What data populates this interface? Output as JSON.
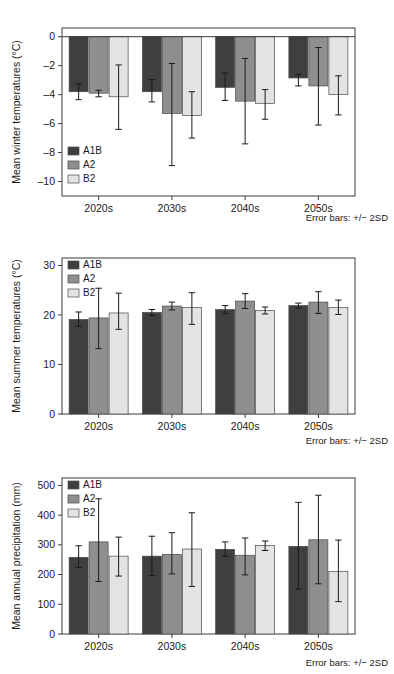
{
  "figure": {
    "background_color": "#ffffff",
    "series_colors": {
      "A1B": "#3f3f3f",
      "A2": "#8f8f8f",
      "B2": "#e3e3e3"
    },
    "axis_color": "#3b3b3b",
    "error_bar_color": "#1a1a1a"
  },
  "panels": [
    {
      "id": "winter",
      "note": "Error bars: +/− 2SD",
      "legend_position": "bottom-left"
    },
    {
      "id": "summer",
      "note": "Error bars: +/− 2SD",
      "legend_position": "top-left"
    },
    {
      "id": "precipitation",
      "note": "Error bars: +/− 2SD",
      "legend_position": "top-left"
    }
  ],
  "chart_data": [
    {
      "type": "bar",
      "id": "winter",
      "title": "",
      "xlabel": "",
      "ylabel": "Mean winter temperatures (°C)",
      "categories": [
        "2020s",
        "2030s",
        "2040s",
        "2050s"
      ],
      "ylim": [
        -11,
        0.6
      ],
      "yticks": [
        0,
        -2,
        -4,
        -6,
        -8,
        -10
      ],
      "yticklabels": [
        "0",
        "–2",
        "–4",
        "–6",
        "–8",
        "–10"
      ],
      "grid": false,
      "legend": [
        "A1B",
        "A2",
        "B2"
      ],
      "annotation": "Error bars: +/− 2SD",
      "series": [
        {
          "name": "A1B",
          "color": "#3f3f3f",
          "values": [
            -3.8,
            -3.8,
            -3.5,
            -2.85
          ],
          "err_low": [
            -4.35,
            -4.5,
            -4.4,
            -3.4
          ],
          "err_high": [
            -3.25,
            -2.95,
            -2.5,
            -2.6
          ]
        },
        {
          "name": "A2",
          "color": "#8f8f8f",
          "values": [
            -3.9,
            -5.3,
            -4.45,
            -3.4
          ],
          "err_low": [
            -4.15,
            -8.9,
            -7.4,
            -6.1
          ],
          "err_high": [
            -3.7,
            -1.85,
            -1.5,
            -0.75
          ]
        },
        {
          "name": "B2",
          "color": "#e3e3e3",
          "values": [
            -4.15,
            -5.45,
            -4.6,
            -4.0
          ],
          "err_low": [
            -6.4,
            -7.0,
            -5.7,
            -5.4
          ],
          "err_high": [
            -1.95,
            -3.8,
            -3.65,
            -2.7
          ]
        }
      ]
    },
    {
      "type": "bar",
      "id": "summer",
      "title": "",
      "xlabel": "",
      "ylabel": "Mean summer temperatures (°C)",
      "categories": [
        "2020s",
        "2030s",
        "2040s",
        "2050s"
      ],
      "ylim": [
        0,
        31.5
      ],
      "yticks": [
        0,
        10,
        20,
        30
      ],
      "yticklabels": [
        "0",
        "10",
        "20",
        "30"
      ],
      "grid": false,
      "legend": [
        "A1B",
        "A2",
        "B2"
      ],
      "annotation": "Error bars: +/− 2SD",
      "series": [
        {
          "name": "A1B",
          "color": "#3f3f3f",
          "values": [
            19.1,
            20.5,
            21.1,
            21.9
          ],
          "err_low": [
            17.7,
            19.9,
            20.3,
            21.4
          ],
          "err_high": [
            20.6,
            21.1,
            21.9,
            22.4
          ]
        },
        {
          "name": "A2",
          "color": "#8f8f8f",
          "values": [
            19.4,
            21.8,
            22.8,
            22.6
          ],
          "err_low": [
            13.2,
            21.0,
            21.3,
            20.3
          ],
          "err_high": [
            25.4,
            22.6,
            24.3,
            24.7
          ]
        },
        {
          "name": "B2",
          "color": "#e3e3e3",
          "values": [
            20.4,
            21.5,
            20.9,
            21.5
          ],
          "err_low": [
            17.1,
            18.1,
            20.2,
            20.1
          ],
          "err_high": [
            24.4,
            24.5,
            21.6,
            23.0
          ]
        }
      ]
    },
    {
      "type": "bar",
      "id": "precipitation",
      "title": "",
      "xlabel": "",
      "ylabel": "Mean annual precipitation (mm)",
      "categories": [
        "2020s",
        "2030s",
        "2040s",
        "2050s"
      ],
      "ylim": [
        0,
        525
      ],
      "yticks": [
        0,
        100,
        200,
        300,
        400,
        500
      ],
      "yticklabels": [
        "0",
        "100",
        "200",
        "300",
        "400",
        "500"
      ],
      "grid": false,
      "legend": [
        "A1B",
        "A2",
        "B2"
      ],
      "annotation": "Error bars: +/− 2SD",
      "series": [
        {
          "name": "A1B",
          "color": "#3f3f3f",
          "values": [
            258,
            262,
            285,
            295
          ],
          "err_low": [
            224,
            197,
            261,
            151
          ],
          "err_high": [
            297,
            329,
            310,
            443
          ]
        },
        {
          "name": "A2",
          "color": "#8f8f8f",
          "values": [
            310,
            268,
            265,
            317
          ],
          "err_low": [
            177,
            202,
            199,
            169
          ],
          "err_high": [
            455,
            341,
            323,
            467
          ]
        },
        {
          "name": "B2",
          "color": "#e3e3e3",
          "values": [
            262,
            286,
            298,
            211
          ],
          "err_low": [
            195,
            160,
            281,
            109
          ],
          "err_high": [
            326,
            408,
            313,
            316
          ]
        }
      ]
    }
  ]
}
